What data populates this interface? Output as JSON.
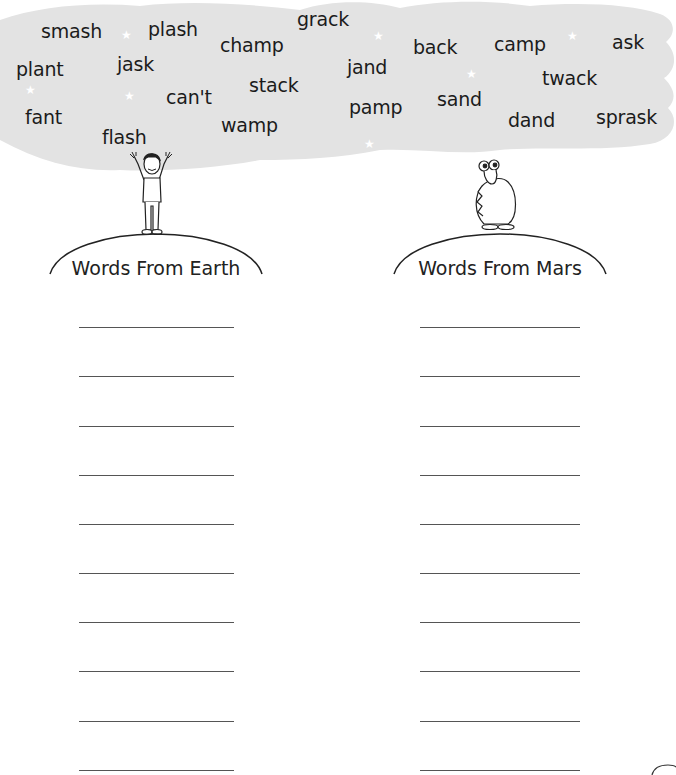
{
  "cloud": {
    "fill_color": "#e3e3e3",
    "words": [
      {
        "text": "smash",
        "x": 41,
        "y": 22
      },
      {
        "text": "plash",
        "x": 148,
        "y": 20
      },
      {
        "text": "champ",
        "x": 220,
        "y": 36
      },
      {
        "text": "grack",
        "x": 297,
        "y": 10
      },
      {
        "text": "back",
        "x": 413,
        "y": 38
      },
      {
        "text": "camp",
        "x": 494,
        "y": 35
      },
      {
        "text": "ask",
        "x": 612,
        "y": 33
      },
      {
        "text": "plant",
        "x": 16,
        "y": 60
      },
      {
        "text": "jask",
        "x": 117,
        "y": 55
      },
      {
        "text": "jand",
        "x": 347,
        "y": 58
      },
      {
        "text": "twack",
        "x": 542,
        "y": 69
      },
      {
        "text": "stack",
        "x": 249,
        "y": 76
      },
      {
        "text": "can't",
        "x": 166,
        "y": 88
      },
      {
        "text": "sand",
        "x": 437,
        "y": 90
      },
      {
        "text": "pamp",
        "x": 349,
        "y": 98
      },
      {
        "text": "fant",
        "x": 25,
        "y": 108
      },
      {
        "text": "dand",
        "x": 508,
        "y": 111
      },
      {
        "text": "sprask",
        "x": 596,
        "y": 108
      },
      {
        "text": "wamp",
        "x": 221,
        "y": 116
      },
      {
        "text": "flash",
        "x": 102,
        "y": 128
      }
    ],
    "stars": [
      {
        "x": 121,
        "y": 29
      },
      {
        "x": 25,
        "y": 86
      },
      {
        "x": 124,
        "y": 90
      },
      {
        "x": 373,
        "y": 30
      },
      {
        "x": 466,
        "y": 68
      },
      {
        "x": 567,
        "y": 30
      },
      {
        "x": 364,
        "y": 138
      }
    ]
  },
  "characters": {
    "earth": {
      "label": "boy-character"
    },
    "mars": {
      "label": "alien-character"
    }
  },
  "columns": [
    {
      "heading": "Words From Earth",
      "line_count": 10
    },
    {
      "heading": "Words From Mars",
      "line_count": 10
    }
  ]
}
